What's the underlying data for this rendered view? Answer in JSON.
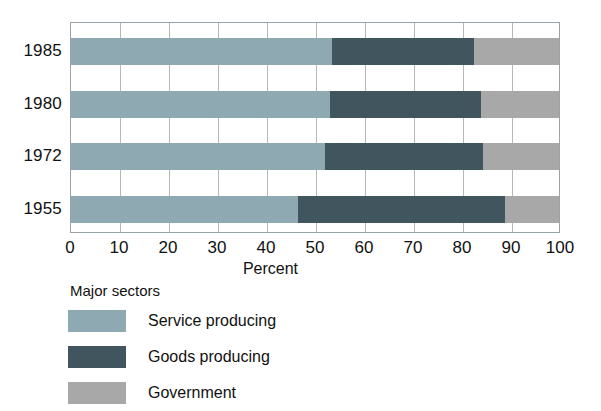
{
  "chart_data": {
    "type": "bar",
    "orientation": "horizontal",
    "stacked": true,
    "title": "",
    "xlabel": "Percent",
    "ylabel": "",
    "xlim": [
      0,
      100
    ],
    "xticks": [
      0,
      10,
      20,
      30,
      40,
      50,
      60,
      70,
      80,
      90,
      100
    ],
    "xtick_labels": [
      "0",
      "10",
      "20",
      "30",
      "40",
      "50",
      "60",
      "70",
      "80",
      "90",
      "100"
    ],
    "grid": true,
    "grid_axis": "x",
    "legend_position": "below-left",
    "legend_title": "Major sectors",
    "categories": [
      "1985",
      "1980",
      "1972",
      "1955"
    ],
    "series": [
      {
        "name": "Service producing",
        "color": "#8fa9b3",
        "values": [
          53.5,
          53.0,
          52.0,
          46.5
        ]
      },
      {
        "name": "Goods producing",
        "color": "#41555e",
        "values": [
          29.0,
          31.0,
          32.5,
          42.5
        ]
      },
      {
        "name": "Government",
        "color": "#a8a8a8",
        "values": [
          17.5,
          16.0,
          15.5,
          11.0
        ]
      }
    ]
  },
  "axis": {
    "x_title": "Percent"
  },
  "legend": {
    "title": "Major sectors",
    "items": [
      {
        "label": "Service producing",
        "color": "#8fa9b3"
      },
      {
        "label": "Goods producing",
        "color": "#41555e"
      },
      {
        "label": "Government",
        "color": "#a8a8a8"
      }
    ]
  },
  "colors": {
    "service": "#8fa9b3",
    "goods": "#41555e",
    "government": "#a8a8a8",
    "frame": "#9aa3a8",
    "grid": "#b2b9bd",
    "text": "#111111",
    "background": "#ffffff"
  }
}
